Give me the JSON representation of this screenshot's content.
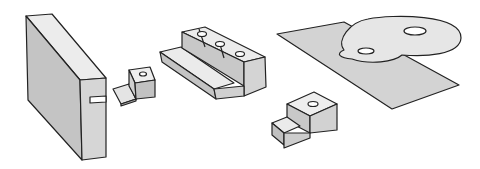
{
  "figure": {
    "type": "isometric-technical-illustration",
    "background": "#ffffff",
    "stroke_color": "#222222",
    "shades": {
      "light": "#e8e8e8",
      "mid": "#cfcfcf",
      "dark": "#b5b5b5"
    },
    "parts": [
      {
        "id": "slotted-block",
        "description": "tall rectangular block with a slot cut in the front edge"
      },
      {
        "id": "z-bracket",
        "description": "small Z-shaped bent sheet bracket with a hole"
      },
      {
        "id": "stepped-block-3-holes",
        "description": "stepped block with three drilled holes on top"
      },
      {
        "id": "plate-with-figure-eight",
        "description": "flat parallelogram plate with figure-eight shaped raised disc, two holes"
      },
      {
        "id": "small-step-block",
        "description": "small stepped block with one hole"
      }
    ]
  }
}
